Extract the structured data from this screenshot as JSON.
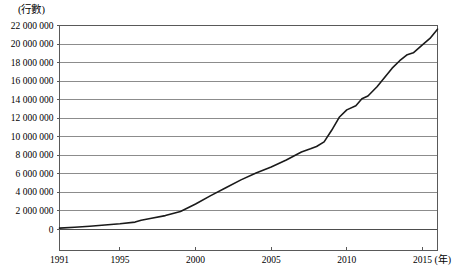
{
  "chart_data": {
    "type": "line",
    "title": "",
    "subtitle": "",
    "xlabel": "(年)",
    "ylabel": "(行數)",
    "xlim": [
      1991,
      2016
    ],
    "ylim": [
      0,
      22000000
    ],
    "grid": true,
    "legend": "none",
    "x_tick_labels": [
      "1991",
      "1995",
      "2000",
      "2005",
      "2010",
      "2015"
    ],
    "x_tick_values": [
      1991,
      1995,
      2000,
      2005,
      2010,
      2015
    ],
    "y_tick_labels": [
      "0",
      "2 000 000",
      "4 000 000",
      "6 000 000",
      "8 000 000",
      "10 000 000",
      "12 000 000",
      "14 000 000",
      "16 000 000",
      "18 000 000",
      "20 000 000",
      "22 000 000"
    ],
    "y_tick_values": [
      0,
      2000000,
      4000000,
      6000000,
      8000000,
      10000000,
      12000000,
      14000000,
      16000000,
      18000000,
      20000000,
      22000000
    ],
    "series": [
      {
        "name": "行數",
        "color": "#1a1a1a",
        "x": [
          1991,
          1992,
          1993,
          1994,
          1995,
          1996,
          1996.4,
          1997,
          1998,
          1999,
          2000,
          2001,
          2002,
          2003,
          2004,
          2005,
          2006,
          2007,
          2007.6,
          2008,
          2008.5,
          2009,
          2009.5,
          2010,
          2010.6,
          2011,
          2011.4,
          2012,
          2013,
          2013.5,
          2014,
          2014.4,
          2015,
          2015.5,
          2016
        ],
        "values": [
          150000,
          250000,
          350000,
          480000,
          620000,
          800000,
          1000000,
          1180000,
          1500000,
          1950000,
          2750000,
          3650000,
          4500000,
          5350000,
          6100000,
          6750000,
          7500000,
          8350000,
          8700000,
          8950000,
          9450000,
          10700000,
          12100000,
          12900000,
          13350000,
          14100000,
          14400000,
          15400000,
          17400000,
          18200000,
          18850000,
          19050000,
          19900000,
          20600000,
          21600000
        ]
      }
    ],
    "annotations": []
  },
  "axes": {
    "y_unit_label": "(行數)",
    "x_unit_label": "(年)"
  },
  "style": {
    "gridline_color": "#808080",
    "frame_color": "#595959",
    "line_color": "#1a1a1a",
    "background": "#ffffff",
    "text_color": "#000000"
  }
}
